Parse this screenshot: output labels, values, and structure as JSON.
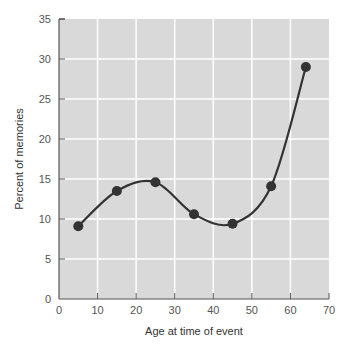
{
  "chart_data": {
    "type": "line",
    "title": "",
    "xlabel": "Age at time of event",
    "ylabel": "Percent of memories",
    "xlim": [
      0,
      70
    ],
    "ylim": [
      0,
      35
    ],
    "x_ticks": [
      0,
      10,
      20,
      30,
      40,
      50,
      60,
      70
    ],
    "y_ticks": [
      0,
      5,
      10,
      15,
      20,
      25,
      30,
      35
    ],
    "grid": true,
    "legend": null,
    "series": [
      {
        "name": "Percent of memories",
        "smooth": true,
        "markers": true,
        "x": [
          5,
          15,
          25,
          35,
          45,
          55,
          64
        ],
        "y": [
          9.1,
          13.5,
          14.6,
          10.6,
          9.4,
          14.1,
          29.0
        ]
      }
    ]
  },
  "colors": {
    "plot_background": "#d9d9d9",
    "gridline": "#ffffff",
    "axis": "#555555",
    "line": "#333333",
    "marker": "#333333"
  }
}
